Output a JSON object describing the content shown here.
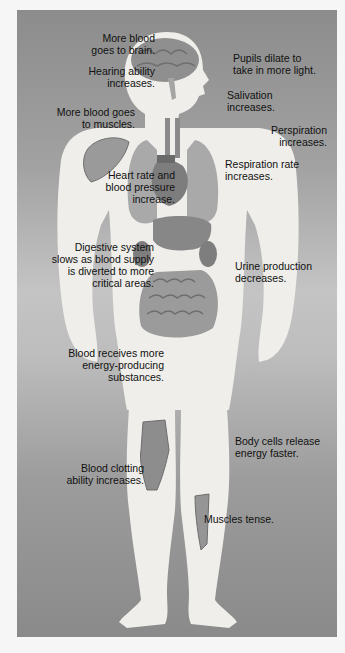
{
  "diagram": {
    "colors": {
      "background_top": "#8c8c8c",
      "background_mid": "#c4c4c4",
      "body": "#efeeea",
      "organ": "#8f8f8f",
      "organ_dark": "#6f6f6f",
      "text": "#111111"
    },
    "labels": {
      "brain": "More blood\ngoes to brain.",
      "hearing": "Hearing ability\nincreases.",
      "muscles_blood": "More blood goes\nto muscles.",
      "pupils": "Pupils dilate to\ntake in more light.",
      "salivation": "Salivation\nincreases.",
      "perspiration": "Perspiration\nincreases.",
      "respiration": "Respiration rate\nincreases.",
      "heart": "Heart rate and\nblood pressure\nincrease.",
      "digestive": "Digestive system\nslows as blood supply\nis diverted to more\ncritical areas.",
      "urine": "Urine production\ndecreases.",
      "energy_blood": "Blood receives more\nenergy-producing\nsubstances.",
      "body_cells": "Body cells release\nenergy faster.",
      "clotting": "Blood clotting\nability increases.",
      "muscles_tense": "Muscles tense."
    }
  }
}
